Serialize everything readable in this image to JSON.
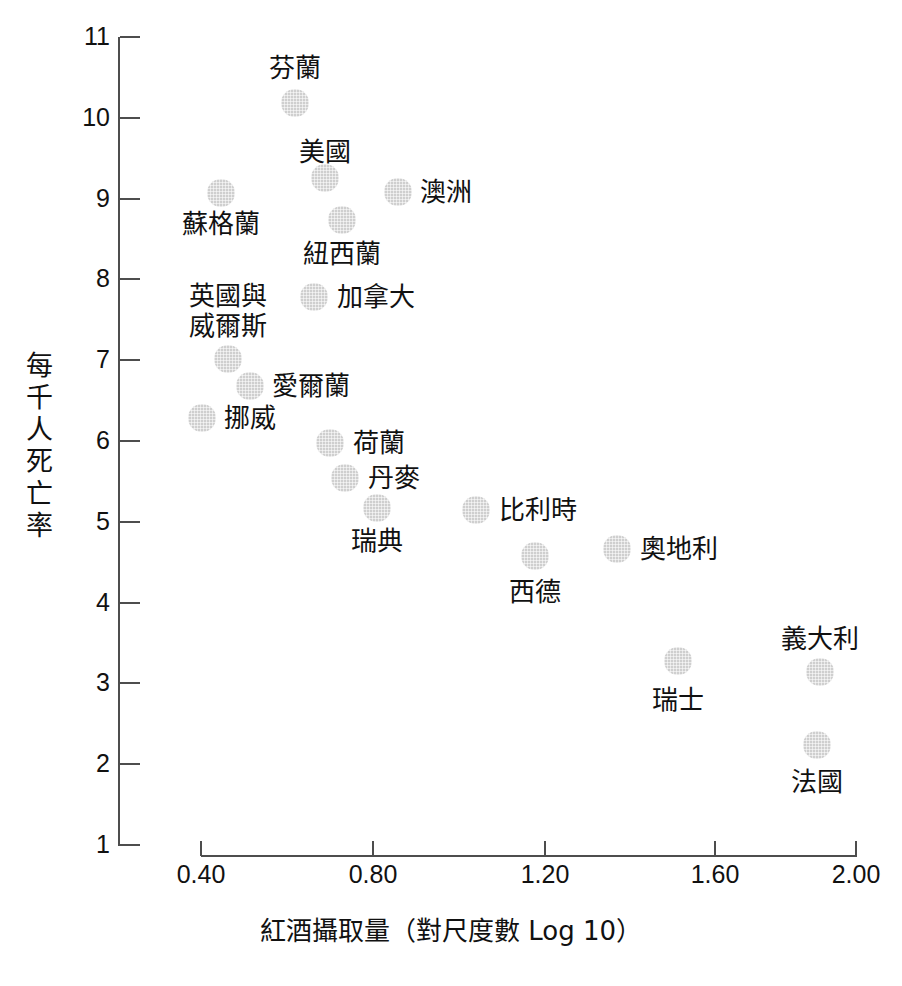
{
  "chart_data": {
    "type": "scatter",
    "title": "",
    "xlabel": "紅酒攝取量（對尺度數 Log 10）",
    "ylabel": "每千人死亡率",
    "xlim": [
      0.3,
      2.05
    ],
    "ylim": [
      1,
      11
    ],
    "grid": false,
    "legend": "none",
    "xticks": [
      "0.40",
      "0.80",
      "1.20",
      "1.60",
      "2.00"
    ],
    "xtick_values": [
      0.4,
      0.8,
      1.2,
      1.6,
      2.0
    ],
    "yticks": [
      "11",
      "10",
      "9",
      "8",
      "7",
      "6",
      "5",
      "4",
      "3",
      "2",
      "1"
    ],
    "ytick_values": [
      11,
      10,
      9,
      8,
      7,
      6,
      5,
      4,
      3,
      2,
      1
    ],
    "point_color": "#cfcfcf",
    "axis_color": "#4d4d4d",
    "text_color": "#111111",
    "points": [
      {
        "label": "芬蘭",
        "x": 0.62,
        "y": 10.18,
        "px": 295,
        "py": 103,
        "lx": 295,
        "ly": 68,
        "anchor": "center"
      },
      {
        "label": "美國",
        "x": 0.63,
        "y": 9.3,
        "px": 325,
        "py": 178,
        "lx": 325,
        "ly": 152,
        "anchor": "center"
      },
      {
        "label": "蘇格蘭",
        "x": 0.44,
        "y": 9.07,
        "px": 221,
        "py": 193,
        "lx": 221,
        "ly": 224,
        "anchor": "center"
      },
      {
        "label": "澳洲",
        "x": 0.87,
        "y": 9.1,
        "px": 398,
        "py": 192,
        "lx": 420,
        "ly": 192,
        "anchor": "left"
      },
      {
        "label": "紐西蘭",
        "x": 0.69,
        "y": 8.73,
        "px": 342,
        "py": 220,
        "lx": 342,
        "ly": 254,
        "anchor": "center"
      },
      {
        "label": "加拿大",
        "x": 0.66,
        "y": 7.85,
        "px": 314,
        "py": 297,
        "lx": 337,
        "ly": 297,
        "anchor": "left"
      },
      {
        "label": "英國與\n威爾斯",
        "x": 0.42,
        "y": 7.05,
        "px": 228,
        "py": 359,
        "lx": 228,
        "ly": 311,
        "anchor": "center"
      },
      {
        "label": "愛爾蘭",
        "x": 0.48,
        "y": 6.69,
        "px": 250,
        "py": 386,
        "lx": 272,
        "ly": 386,
        "anchor": "left"
      },
      {
        "label": "挪威",
        "x": 0.34,
        "y": 6.3,
        "px": 202,
        "py": 418,
        "lx": 224,
        "ly": 418,
        "anchor": "left"
      },
      {
        "label": "荷蘭",
        "x": 0.7,
        "y": 5.9,
        "px": 330,
        "py": 443,
        "lx": 353,
        "ly": 443,
        "anchor": "left"
      },
      {
        "label": "丹麥",
        "x": 0.74,
        "y": 5.55,
        "px": 345,
        "py": 478,
        "lx": 368,
        "ly": 478,
        "anchor": "left"
      },
      {
        "label": "瑞典",
        "x": 0.81,
        "y": 5.1,
        "px": 377,
        "py": 508,
        "lx": 377,
        "ly": 541,
        "anchor": "center"
      },
      {
        "label": "比利時",
        "x": 1.04,
        "y": 5.15,
        "px": 476,
        "py": 510,
        "lx": 499,
        "ly": 510,
        "anchor": "left"
      },
      {
        "label": "西德",
        "x": 1.18,
        "y": 4.55,
        "px": 535,
        "py": 556,
        "lx": 535,
        "ly": 592,
        "anchor": "center"
      },
      {
        "label": "奧地利",
        "x": 1.37,
        "y": 4.63,
        "px": 617,
        "py": 549,
        "lx": 640,
        "ly": 549,
        "anchor": "left"
      },
      {
        "label": "瑞士",
        "x": 1.51,
        "y": 3.18,
        "px": 678,
        "py": 661,
        "lx": 678,
        "ly": 700,
        "anchor": "center"
      },
      {
        "label": "義大利",
        "x": 1.88,
        "y": 3.07,
        "px": 820,
        "py": 672,
        "lx": 820,
        "ly": 639,
        "anchor": "center"
      },
      {
        "label": "法國",
        "x": 1.87,
        "y": 2.15,
        "px": 817,
        "py": 745,
        "lx": 817,
        "ly": 782,
        "anchor": "center"
      }
    ]
  }
}
